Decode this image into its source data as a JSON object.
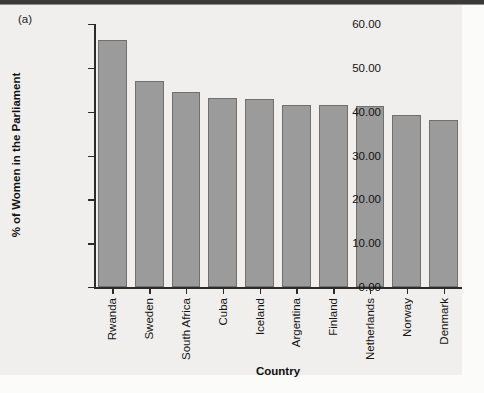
{
  "figure": {
    "panel_label": "(a)",
    "background_color": "#f0efed",
    "bar_fill_color": "#9b9b9b",
    "bar_edge_color": "#6f6f6f",
    "axis_color": "#2b2b2b"
  },
  "chart_data": {
    "type": "bar",
    "title": "",
    "subtitle": "",
    "xlabel": "Country",
    "ylabel": "% of Women in the Parliament",
    "categories": [
      "Rwanda",
      "Sweden",
      "South Africa",
      "Cuba",
      "Iceland",
      "Argentina",
      "Finland",
      "Netherlands",
      "Norway",
      "Denmark"
    ],
    "values": [
      56.3,
      47.0,
      44.5,
      43.2,
      42.8,
      41.6,
      41.5,
      41.2,
      39.3,
      38.0
    ],
    "ylim": [
      0,
      60
    ],
    "ytick_step": 10,
    "ytick_labels": [
      "0.00",
      "10.00",
      "20.00",
      "30.00",
      "40.00",
      "50.00",
      "60.00"
    ],
    "ytick_values": [
      0,
      10,
      20,
      30,
      40,
      50,
      60
    ],
    "grid": false,
    "legend": null,
    "annotations": [
      "(a)"
    ]
  }
}
